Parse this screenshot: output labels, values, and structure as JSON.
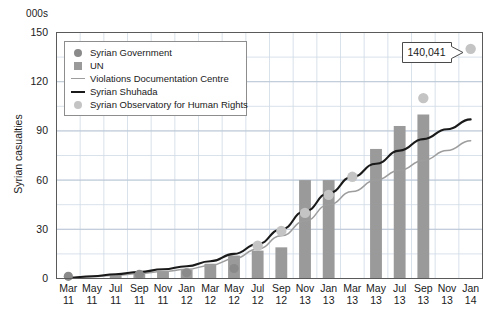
{
  "chart_data": {
    "type": "bar",
    "title": "",
    "subtitle": "",
    "unit_label": "000s",
    "ylabel": "Syrian casualties",
    "xlabel": "",
    "ylim": [
      0,
      150
    ],
    "yticks": [
      0,
      30,
      60,
      90,
      120,
      150
    ],
    "grid": true,
    "legend_position": "top-left",
    "categories": [
      "Mar 11",
      "May 11",
      "Jul 11",
      "Sep 11",
      "Nov 11",
      "Jan 12",
      "Mar 12",
      "May 12",
      "Jul 12",
      "Sep 12",
      "Nov 12",
      "Jan 13",
      "Mar 13",
      "May 13",
      "Jul 13",
      "Sep 13",
      "Nov 13",
      "Jan 14"
    ],
    "xtick_months": [
      "Mar",
      "May",
      "Jul",
      "Sep",
      "Nov",
      "Jan",
      "Mar",
      "May",
      "Jul",
      "Sep",
      "Nov",
      "Jan",
      "Mar",
      "May",
      "Jul",
      "Sep",
      "Nov",
      "Jan"
    ],
    "xtick_years": [
      "11",
      "11",
      "11",
      "11",
      "11",
      "12",
      "12",
      "12",
      "12",
      "12",
      "13",
      "13",
      "13",
      "13",
      "13",
      "13",
      "13",
      "14"
    ],
    "series": [
      {
        "name": "Syrian Government",
        "type": "scatter",
        "color": "#8a8a8a",
        "points": [
          {
            "x": "Mar 11",
            "y": 1.3
          },
          {
            "x": "Sep 11",
            "y": 2.6
          },
          {
            "x": "Jan 12",
            "y": 3.5
          },
          {
            "x": "May 12",
            "y": 6.1
          }
        ]
      },
      {
        "name": "UN",
        "type": "bar",
        "color": "#9a9a9a",
        "values": [
          0,
          0,
          2.2,
          3.0,
          4.5,
          5.5,
          9.0,
          14.0,
          17.0,
          19.0,
          60.0,
          60.0,
          0,
          79.0,
          93.0,
          100.0,
          0,
          0
        ]
      },
      {
        "name": "Violations Documentation Centre",
        "type": "line",
        "color": "#9d9d9d",
        "values": [
          0.4,
          1.1,
          2.0,
          3.0,
          4.2,
          5.6,
          8.0,
          12.0,
          18.0,
          26.0,
          35.0,
          45.0,
          53.0,
          60.0,
          66.0,
          72.0,
          78.0,
          84.0
        ]
      },
      {
        "name": "Syrian Shuhada",
        "type": "line",
        "color": "#1a1a1a",
        "values": [
          0.5,
          1.4,
          2.6,
          4.0,
          5.6,
          7.5,
          10.5,
          15.0,
          21.0,
          30.0,
          41.0,
          52.0,
          62.0,
          70.0,
          78.0,
          85.0,
          91.0,
          97.0
        ]
      },
      {
        "name": "Syrian Observatory for Human Rights",
        "type": "scatter",
        "color": "#c4c4c4",
        "points": [
          {
            "x": "Jul 12",
            "y": 20.0
          },
          {
            "x": "Sep 12",
            "y": 29.0
          },
          {
            "x": "Nov 12",
            "y": 40.0
          },
          {
            "x": "Jan 13",
            "y": 51.0
          },
          {
            "x": "Mar 13",
            "y": 62.0
          },
          {
            "x": "Sep 13",
            "y": 110.0
          },
          {
            "x": "Jan 14",
            "y": 140.041
          }
        ]
      }
    ],
    "annotations": [
      {
        "name": "sohr-latest-callout",
        "text": "140,041",
        "target_x": "Jan 14",
        "target_y": 140.041
      }
    ],
    "colors": {
      "bar": "#9a9a9a",
      "gov_dot": "#8a8a8a",
      "vdc_line": "#9d9d9d",
      "shuhada_line": "#1a1a1a",
      "sohr_dot": "#c4c4c4",
      "grid": "#cfd9e6",
      "axis": "#5a5a5a",
      "callout_border": "#4a4a4a"
    }
  },
  "legend": {
    "items": [
      {
        "label": "Syrian Government",
        "marker": "circle-marker",
        "color": "#8a8a8a"
      },
      {
        "label": "UN",
        "marker": "square-marker",
        "color": "#9a9a9a"
      },
      {
        "label": "Violations Documentation Centre",
        "marker": "thin-line-marker",
        "color": "#9d9d9d"
      },
      {
        "label": "Syrian Shuhada",
        "marker": "thick-line-marker",
        "color": "#1a1a1a"
      },
      {
        "label": "Syrian Observatory for Human Rights",
        "marker": "circle-marker",
        "color": "#c4c4c4"
      }
    ]
  }
}
